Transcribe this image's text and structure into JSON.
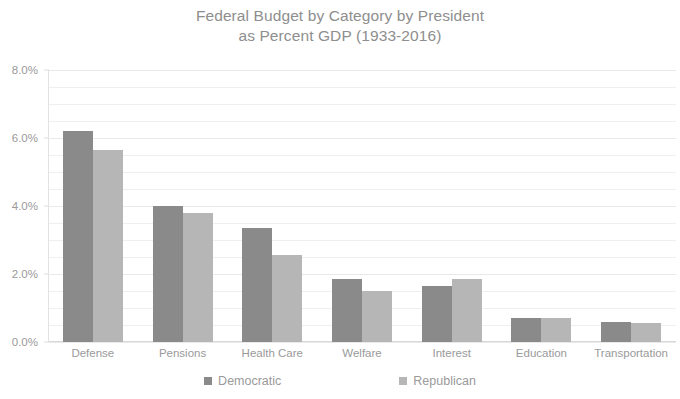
{
  "chart_data": {
    "type": "bar",
    "title": "Federal Budget by Category by President\nas Percent GDP (1933-2016)",
    "title_line1": "Federal Budget by Category by President",
    "title_line2": "as Percent GDP (1933-2016)",
    "xlabel": "",
    "ylabel": "",
    "ylim": [
      0,
      8
    ],
    "ytick_values": [
      0,
      2,
      4,
      6,
      8
    ],
    "ytick_labels": [
      "0.0%",
      "2.0%",
      "4.0%",
      "6.0%",
      "8.0%"
    ],
    "minor_gridline_step": 0.5,
    "grid": true,
    "legend_position": "bottom",
    "categories": [
      "Defense",
      "Pensions",
      "Health Care",
      "Welfare",
      "Interest",
      "Education",
      "Transportation"
    ],
    "series": [
      {
        "name": "Democratic",
        "color": "#8a8a8a",
        "values": [
          6.2,
          4.0,
          3.35,
          1.85,
          1.65,
          0.7,
          0.6
        ]
      },
      {
        "name": "Republican",
        "color": "#b6b6b6",
        "values": [
          5.65,
          3.8,
          2.55,
          1.5,
          1.85,
          0.7,
          0.55
        ]
      }
    ]
  }
}
